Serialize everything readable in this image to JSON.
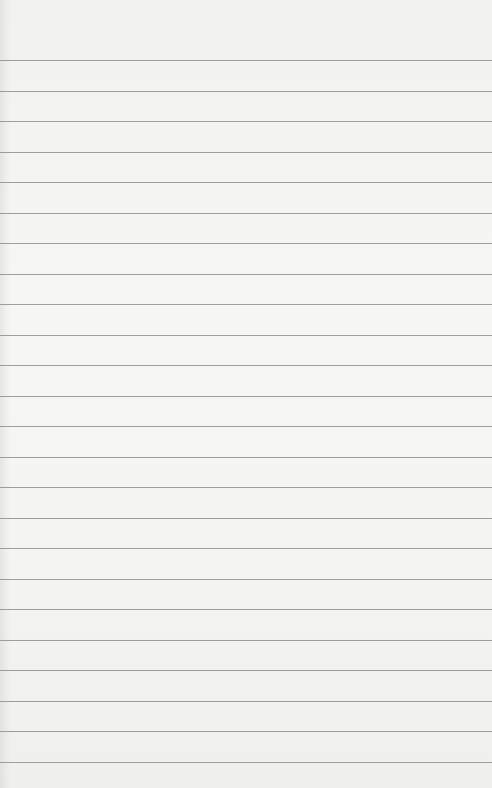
{
  "image": {
    "subject": "blank lined paper",
    "background_color": "#f3f3f1",
    "line_color": "#8e8e8c",
    "line_count": 24,
    "first_line_y": 60,
    "line_spacing": 30.5
  }
}
